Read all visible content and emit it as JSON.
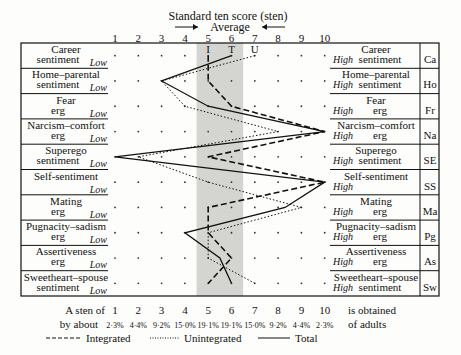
{
  "header": {
    "title": "Standard ten score (sten)",
    "average_label": "Average"
  },
  "footer": {
    "sten_label": "A sten of",
    "obtained_label": "is obtained",
    "by_about_label": "by about",
    "of_adults_label": "of adults",
    "percentages": [
      "2·3%",
      "4·4%",
      "9·2%",
      "15·0%",
      "19·1%",
      "19·1%",
      "15·0%",
      "9·2%",
      "4·4%",
      "2·3%"
    ]
  },
  "legend": [
    {
      "name": "Integrated",
      "style": "dashed"
    },
    {
      "name": "Unintegrated",
      "style": "dotted"
    },
    {
      "name": "Total",
      "style": "solid"
    }
  ],
  "chart_data": {
    "type": "line",
    "title": "Standard ten score (sten)",
    "xlabel": "Standard ten score (sten)",
    "x_ticks": [
      1,
      2,
      3,
      4,
      5,
      6,
      7,
      8,
      9,
      10
    ],
    "xlim": [
      1,
      10
    ],
    "average_band": [
      4.5,
      6.5
    ],
    "column_markers": [
      {
        "label": "I",
        "x": 5
      },
      {
        "label": "T",
        "x": 6
      },
      {
        "label": "U",
        "x": 7
      }
    ],
    "categories": [
      {
        "low": "Career sentiment",
        "high": "Career sentiment",
        "code": "Ca"
      },
      {
        "low": "Home–parental sentiment",
        "high": "Home–parental sentiment",
        "code": "Ho"
      },
      {
        "low": "Fear erg",
        "high": "Fear erg",
        "code": "Fr"
      },
      {
        "low": "Narcism–comfort erg",
        "high": "Narcism–comfort erg",
        "code": "Na"
      },
      {
        "low": "Superego sentiment",
        "high": "Superego sentiment",
        "code": "SE"
      },
      {
        "low": "Self-sentiment",
        "high": "Self-sentiment",
        "code": "SS"
      },
      {
        "low": "Mating erg",
        "high": "Mating erg",
        "code": "Ma"
      },
      {
        "low": "Pugnacity–sadism erg",
        "high": "Pugnacity–sadism erg",
        "code": "Pg"
      },
      {
        "low": "Assertiveness erg",
        "high": "Assertiveness erg",
        "code": "As"
      },
      {
        "low": "Sweetheart–spouse sentiment",
        "high": "Sweetheart–spouse sentiment",
        "code": "Sw"
      }
    ],
    "low_label": "Low",
    "high_label": "High",
    "series": [
      {
        "name": "Integrated",
        "style": "dashed",
        "values": [
          5,
          5,
          6,
          10,
          5,
          10,
          5,
          5,
          6,
          5
        ]
      },
      {
        "name": "Unintegrated",
        "style": "dotted",
        "values": [
          7,
          3,
          4,
          8,
          2,
          5,
          9,
          5,
          5,
          7
        ]
      },
      {
        "name": "Total",
        "style": "solid",
        "values": [
          6,
          3,
          5,
          10,
          1,
          10,
          8.3,
          4,
          5.5,
          6
        ]
      }
    ]
  }
}
